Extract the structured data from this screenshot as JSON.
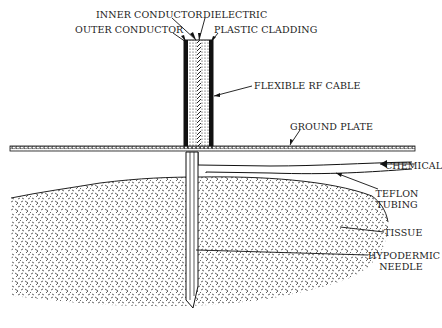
{
  "diagram": {
    "labels": {
      "inner_conductor": "INNER CONDUCTOR",
      "dielectric": "DIELECTRIC",
      "outer_conductor": "OUTER CONDUCTOR",
      "plastic_cladding": "PLASTIC CLADDING",
      "flexible_rf_cable": "FLEXIBLE RF CABLE",
      "ground_plate": "GROUND PLATE",
      "chemical": "CHEMICAL",
      "teflon_tubing_1": "TEFLON",
      "teflon_tubing_2": "TUBING",
      "tissue": "TISSUE",
      "hypodermic_needle_1": "HYPODERMIC",
      "hypodermic_needle_2": "NEEDLE"
    },
    "colors": {
      "ink": "#1a1a1a",
      "background": "#ffffff"
    }
  }
}
